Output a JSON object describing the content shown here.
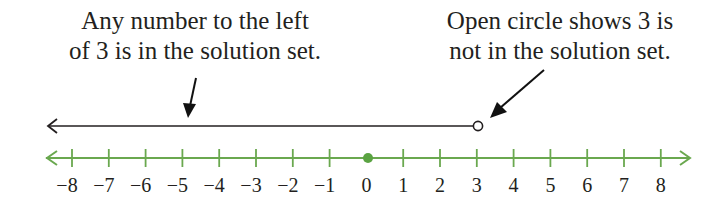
{
  "annotations": {
    "left": {
      "line1": "Any number to the left",
      "line2": "of 3 is in the solution set."
    },
    "right": {
      "line1": "Open circle shows 3 is",
      "line2": "not in the solution set."
    }
  },
  "number_line": {
    "min": -8,
    "max": 8,
    "ticks": [
      "−8",
      "−7",
      "−6",
      "−5",
      "−4",
      "−3",
      "−2",
      "−1",
      "0",
      "1",
      "2",
      "3",
      "4",
      "5",
      "6",
      "7",
      "8"
    ],
    "filled_point": 0,
    "open_point": 3,
    "colors": {
      "axis": "#6aa84f",
      "solution": "#231f20",
      "point": "#5aa342"
    }
  },
  "solution_ray": {
    "direction": "left",
    "endpoint": 3,
    "endpoint_type": "open-circle"
  }
}
